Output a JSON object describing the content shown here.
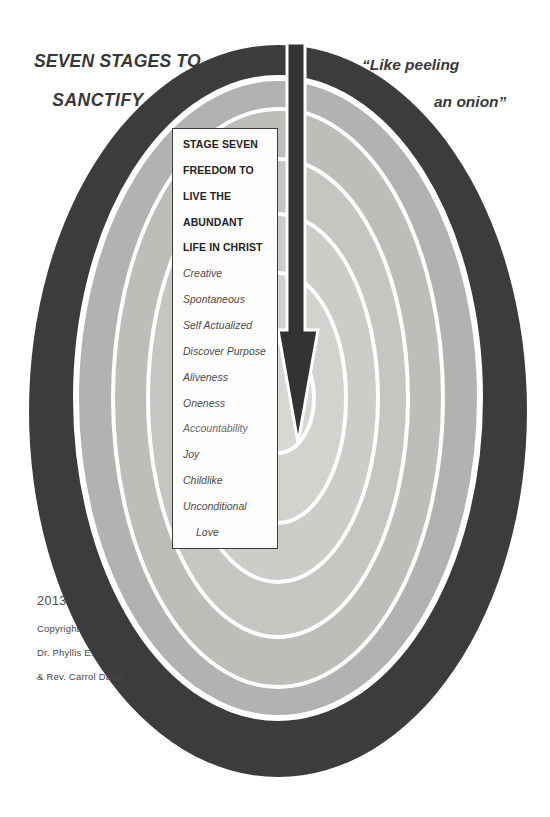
{
  "titles": {
    "left_line1": "SEVEN STAGES TO",
    "left_line2": "SANCTIFY",
    "right_line1": "“Like peeling",
    "right_line2": "an onion”"
  },
  "stage_box": {
    "bold_lines": [
      "STAGE SEVEN",
      "FREEDOM TO",
      "LIVE THE",
      "ABUNDANT",
      "LIFE IN CHRIST"
    ],
    "italic_lines": [
      "Creative",
      "Spontaneous",
      "Self Actualized",
      "Discover Purpose",
      "Aliveness",
      "Oneness",
      "Accountability",
      "Joy",
      "Childlike",
      "Unconditional",
      "Love"
    ]
  },
  "copyright": {
    "year": "2013",
    "line1": "Copyright",
    "line2": "Dr. Phyllis E.",
    "line3": "& Rev. Carrol Davis"
  },
  "diagram": {
    "type": "onion-layers",
    "layer_count": 7,
    "rings": [
      {
        "name": "ring-1-outer",
        "color": "#3c3c3c"
      },
      {
        "name": "ring-2",
        "color": "#b1b3b0"
      },
      {
        "name": "ring-3",
        "color": "#bcbeb9"
      },
      {
        "name": "ring-4",
        "color": "#c4c6c1"
      },
      {
        "name": "ring-5",
        "color": "#cbcdc8"
      },
      {
        "name": "ring-6",
        "color": "#d1d3ce"
      },
      {
        "name": "ring-7-center",
        "color": "#d7d8d3"
      }
    ],
    "arrow": {
      "direction": "down",
      "color": "#333333"
    }
  }
}
